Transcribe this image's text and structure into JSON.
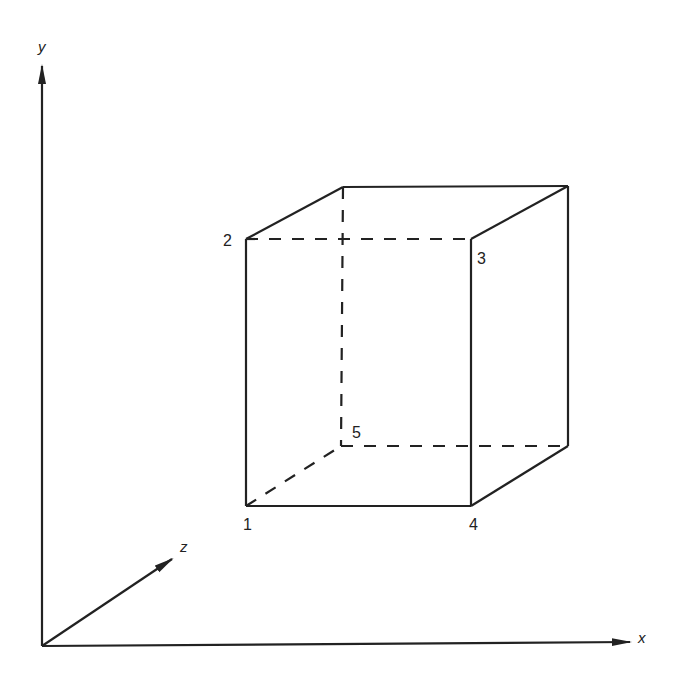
{
  "axes": {
    "y": {
      "label": "y"
    },
    "z": {
      "label": "z"
    },
    "x": {
      "label": "x"
    }
  },
  "vertices": [
    {
      "id": "1",
      "label": "1"
    },
    {
      "id": "2",
      "label": "2"
    },
    {
      "id": "3",
      "label": "3"
    },
    {
      "id": "4",
      "label": "4"
    },
    {
      "id": "5",
      "label": "5"
    }
  ],
  "colors": {
    "stroke": "#222222",
    "background": "#ffffff"
  }
}
